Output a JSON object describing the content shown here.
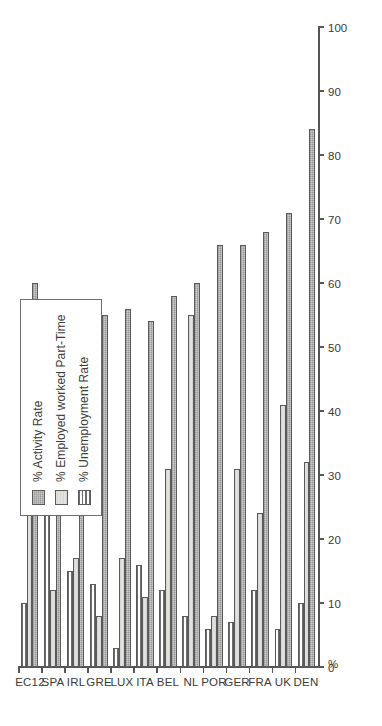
{
  "chart_data": {
    "type": "bar",
    "orientation": "horizontal",
    "title": "",
    "subtitle": "",
    "xlabel": "",
    "ylabel": "%",
    "axis_label": "%",
    "categories": [
      "DEN",
      "UK",
      "FRA",
      "GER",
      "POR",
      "NL",
      "BEL",
      "ITA",
      "LUX",
      "GRE",
      "IRL",
      "SPA",
      "EC12"
    ],
    "series": [
      {
        "name": "% Activity Rate",
        "pattern": "dotted-gray",
        "color": "#9a9a9a",
        "values": [
          84,
          71,
          68,
          66,
          66,
          60,
          58,
          54,
          56,
          55,
          53,
          49,
          60
        ]
      },
      {
        "name": "% Employed worked Part-Time",
        "pattern": "light-solid",
        "color": "#e3e1de",
        "values": [
          32,
          41,
          24,
          31,
          8,
          55,
          31,
          11,
          17,
          8,
          17,
          12,
          28
        ]
      },
      {
        "name": "% Unemployment Rate",
        "pattern": "horizontal-stripes",
        "color": "#ffffff",
        "values": [
          10,
          6,
          12,
          7,
          6,
          8,
          12,
          16,
          3,
          13,
          15,
          24,
          10
        ]
      }
    ],
    "value_ticks": [
      0,
      10,
      20,
      30,
      40,
      50,
      60,
      70,
      80,
      90,
      100
    ],
    "xlim": [
      0,
      100
    ],
    "grid": false,
    "legend_position": "upper-left"
  },
  "legend": {
    "entries": [
      {
        "label": "% Activity Rate",
        "swatch": "swatch-activity"
      },
      {
        "label": "% Employed worked Part-Time",
        "swatch": "swatch-parttime"
      },
      {
        "label": "% Unemployment Rate",
        "swatch": "swatch-unemployment"
      }
    ]
  },
  "axis": {
    "unit_label": "%",
    "tick_labels": [
      "0",
      "10",
      "20",
      "30",
      "40",
      "50",
      "60",
      "70",
      "80",
      "90",
      "100"
    ]
  },
  "colors": {
    "activity": "#9a9a9a",
    "part_time": "#e3e1de",
    "unemployment": "#ffffff",
    "axis": "#555555",
    "text": "#3a3a3a",
    "background": "#ffffff"
  }
}
